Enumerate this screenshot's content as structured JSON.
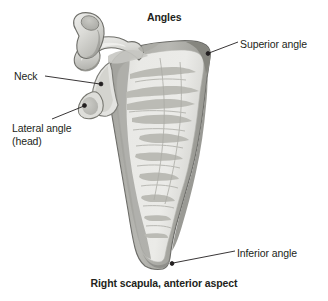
{
  "figure": {
    "title": "Angles",
    "caption": "Right scapula, anterior aspect",
    "background_color": "#ffffff",
    "colors": {
      "bone_light": "#e9e9e7",
      "bone_mid": "#d2d2ce",
      "bone_shadow": "#a9a9a4",
      "bone_dark": "#8e8e8a",
      "outline": "#6f6f6b",
      "text": "#231f20",
      "leader_line": "#231f20"
    },
    "labels": [
      {
        "id": "superior-angle",
        "text": "Superior angle",
        "position": "top-right",
        "leader": {
          "from_x": 238,
          "from_y": 43,
          "to_x": 208,
          "to_y": 54
        }
      },
      {
        "id": "neck",
        "text": "Neck",
        "position": "left",
        "leader": {
          "from_x": 46,
          "from_y": 76,
          "to_x": 101,
          "to_y": 84
        }
      },
      {
        "id": "lateral-angle",
        "text": "Lateral angle\n(head)",
        "line1": "Lateral angle",
        "line2": "(head)",
        "position": "left-lower",
        "leader": {
          "from_x": 52,
          "from_y": 120,
          "to_x": 84,
          "to_y": 106
        }
      },
      {
        "id": "inferior-angle",
        "text": "Inferior angle",
        "position": "bottom-right",
        "leader": {
          "from_x": 235,
          "from_y": 252,
          "to_x": 172,
          "to_y": 264
        }
      }
    ]
  }
}
